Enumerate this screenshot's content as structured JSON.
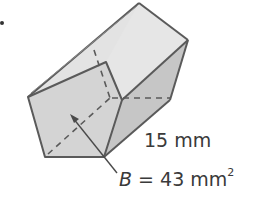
{
  "figure": {
    "shape": "pentagonal prism",
    "height_label": "15 mm",
    "base_label": {
      "variable": "B",
      "equals": " = 43 mm",
      "exponent": "2"
    },
    "colors": {
      "front_face": "#d4d4d4",
      "top_face": "#e6e6e6",
      "side_face": "#c6c6c6",
      "edge": "#5a5a5a",
      "text": "#3a3a3a"
    }
  }
}
